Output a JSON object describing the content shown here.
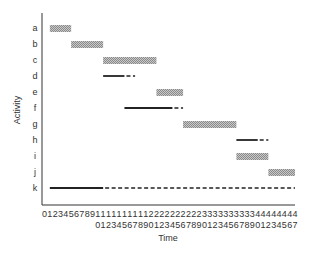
{
  "chart_data": {
    "type": "gantt",
    "title": "",
    "xlabel": "Time",
    "ylabel": "Activity",
    "xlim": [
      0,
      47
    ],
    "x_ticks": [
      "0",
      "1",
      "2",
      "3",
      "4",
      "5",
      "6",
      "7",
      "8",
      "9",
      "10",
      "11",
      "12",
      "13",
      "14",
      "15",
      "16",
      "17",
      "18",
      "19",
      "20",
      "21",
      "22",
      "23",
      "24",
      "25",
      "26",
      "27",
      "28",
      "29",
      "30",
      "31",
      "32",
      "33",
      "34",
      "35",
      "36",
      "37",
      "38",
      "39",
      "40",
      "41",
      "42",
      "43",
      "44",
      "45",
      "46",
      "47"
    ],
    "legend": {
      "shaded_bar": "critical activity",
      "solid_line": "non-critical activity duration",
      "dashed_line": "slack / float"
    },
    "activities": [
      {
        "name": "a",
        "style": "bar",
        "start": 1,
        "end": 5
      },
      {
        "name": "b",
        "style": "bar",
        "start": 5,
        "end": 11
      },
      {
        "name": "c",
        "style": "bar",
        "start": 11,
        "end": 21
      },
      {
        "name": "d",
        "style": "line",
        "start": 11,
        "end": 15,
        "slack_end": 17
      },
      {
        "name": "e",
        "style": "bar",
        "start": 21,
        "end": 26
      },
      {
        "name": "f",
        "style": "line",
        "start": 15,
        "end": 24,
        "slack_end": 26
      },
      {
        "name": "g",
        "style": "bar",
        "start": 26,
        "end": 36
      },
      {
        "name": "h",
        "style": "line",
        "start": 36,
        "end": 40,
        "slack_end": 42
      },
      {
        "name": "i",
        "style": "bar",
        "start": 36,
        "end": 42
      },
      {
        "name": "j",
        "style": "bar",
        "start": 42,
        "end": 47
      },
      {
        "name": "k",
        "style": "line",
        "start": 1,
        "end": 11,
        "slack_end": 47
      }
    ]
  },
  "labels": {
    "xlabel": "Time",
    "ylabel": "Activity",
    "tick_row1": "012345678911111111112222222222333333333344444444",
    "tick_row2": "0123456789012345678901234567",
    "rows": [
      "a",
      "b",
      "c",
      "d",
      "e",
      "f",
      "g",
      "h",
      "i",
      "j",
      "k"
    ]
  }
}
